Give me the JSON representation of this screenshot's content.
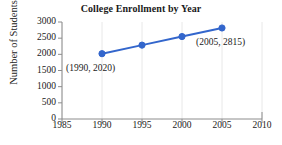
{
  "chart_data": {
    "type": "line",
    "title": "College Enrollment by Year",
    "xlabel": "",
    "ylabel": "Number of Students",
    "x": [
      1990,
      1995,
      2000,
      2005
    ],
    "values": [
      2020,
      2285,
      2550,
      2815
    ],
    "series": [
      {
        "name": "College Enrollment",
        "x": [
          1990,
          1995,
          2000,
          2005
        ],
        "values": [
          2020,
          2285,
          2550,
          2815
        ]
      }
    ],
    "xlim": [
      1985,
      2010
    ],
    "ylim": [
      0,
      3000
    ],
    "x_ticks": [
      1985,
      1990,
      1995,
      2000,
      2005,
      2010
    ],
    "x_tick_labels": [
      "1985",
      "1990",
      "1995",
      "2000",
      "2005",
      "2010"
    ],
    "y_ticks": [
      0,
      500,
      1000,
      1500,
      2000,
      2500,
      3000
    ],
    "y_tick_labels": [
      "0",
      "500",
      "1000",
      "1500",
      "2000",
      "2500",
      "3000"
    ],
    "annotations": [
      {
        "label": "(1990, 2020)",
        "x": 1990,
        "y": 2020
      },
      {
        "label": "(2005, 2815)",
        "x": 2005,
        "y": 2815
      }
    ],
    "legend": null,
    "legend_position": "none",
    "grid": "vertical",
    "colors": {
      "line": "#3366CC",
      "marker": "#3366CC",
      "grid": "#E8E8E8",
      "axis": "#8C8C8C",
      "text": "#1A1A1A",
      "background": "#FFFFFF"
    }
  }
}
